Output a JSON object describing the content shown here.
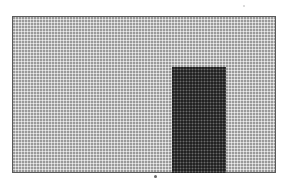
{
  "figure": {
    "frame": {
      "fill_color": "#d2d2d2",
      "border_color": "#5a5a5a"
    },
    "block": {
      "fill_color": "#3e3e3e"
    },
    "marker": {
      "color": "#6a6a6a"
    }
  }
}
